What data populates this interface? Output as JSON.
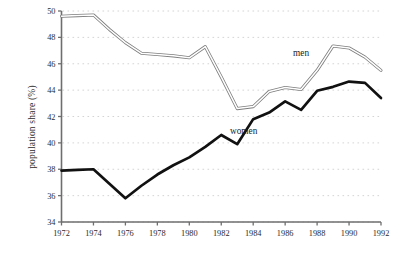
{
  "chart_data": {
    "type": "line",
    "title": "",
    "xlabel": "",
    "ylabel": "population share (%)",
    "x": [
      1972,
      1973,
      1974,
      1975,
      1976,
      1977,
      1978,
      1979,
      1980,
      1981,
      1982,
      1983,
      1984,
      1985,
      1986,
      1987,
      1988,
      1989,
      1990,
      1991,
      1992
    ],
    "xticks": [
      1972,
      1974,
      1976,
      1978,
      1980,
      1982,
      1984,
      1986,
      1988,
      1990,
      1992
    ],
    "xlim": [
      1972,
      1992
    ],
    "ylim": [
      34,
      50
    ],
    "yticks": [
      34,
      36,
      38,
      40,
      42,
      44,
      46,
      48,
      50
    ],
    "grid": "horizontal-dotted",
    "legend": "inline-annotations",
    "series": [
      {
        "name": "men",
        "style": "double-hollow-line",
        "color": "#7d7d7d",
        "label_x": 1987.0,
        "label_y": 46.6,
        "values": [
          49.6,
          49.65,
          49.7,
          48.6,
          47.6,
          46.8,
          46.7,
          46.6,
          46.45,
          47.3,
          45.0,
          42.6,
          42.75,
          43.9,
          44.2,
          44.05,
          45.5,
          47.35,
          47.2,
          46.5,
          45.5
        ]
      },
      {
        "name": "women",
        "style": "solid-thick-line",
        "color": "#111111",
        "label_x": 1983.4,
        "label_y": 40.7,
        "values": [
          37.9,
          37.95,
          38.0,
          36.9,
          35.8,
          36.75,
          37.6,
          38.3,
          38.9,
          39.7,
          40.6,
          39.9,
          41.8,
          42.3,
          43.15,
          42.5,
          43.95,
          44.25,
          44.65,
          44.55,
          43.4
        ]
      }
    ]
  },
  "annotations": {
    "men_label": "men",
    "women_label": "women"
  },
  "axis": {
    "y_title": "population share (%)",
    "y_tick_labels": [
      "34",
      "36",
      "38",
      "40",
      "42",
      "44",
      "46",
      "48",
      "50"
    ],
    "x_tick_labels": [
      "1972",
      "1974",
      "1976",
      "1978",
      "1980",
      "1982",
      "1984",
      "1986",
      "1988",
      "1990",
      "1992"
    ]
  },
  "colors": {
    "axis": "#6e6e6e",
    "grid": "#c9c9c9",
    "men_line": "#7d7d7d",
    "women_line": "#111111",
    "background": "#ffffff",
    "text": "#2b2b2b"
  }
}
